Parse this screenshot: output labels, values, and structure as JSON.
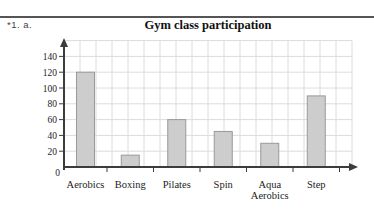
{
  "page": {
    "problem_label": "*1. a."
  },
  "chart_data": {
    "type": "bar",
    "title": "Gym class participation",
    "categories": [
      "Aerobics",
      "Boxing",
      "Pilates",
      "Spin",
      "Aqua Aerobics",
      "Step"
    ],
    "category_label_lines": [
      [
        "Aerobics"
      ],
      [
        "Boxing"
      ],
      [
        "Pilates"
      ],
      [
        "Spin"
      ],
      [
        "Aqua",
        "Aerobics"
      ],
      [
        "Step"
      ]
    ],
    "values": [
      120,
      15,
      60,
      45,
      30,
      90
    ],
    "xlabel": "",
    "ylabel": "",
    "ylim": [
      0,
      160
    ],
    "ytick_interval": 20,
    "ytick_labels": [
      "0",
      "20",
      "40",
      "60",
      "80",
      "100",
      "120",
      "140"
    ],
    "grid": true,
    "legend": "none",
    "colors": {
      "bar_fill": "#cdcdcd",
      "bar_border": "#999999",
      "grid_line": "#dcdcdc",
      "axis": "#3c3c3c",
      "text": "#1c1c1c"
    }
  }
}
